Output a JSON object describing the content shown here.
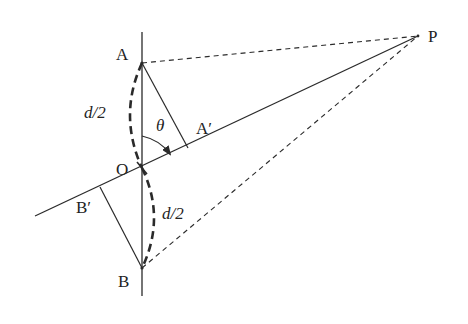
{
  "diagram": {
    "colors": {
      "line": "#2a2a2a",
      "background": "#ffffff"
    },
    "points": {
      "A": {
        "label": "A"
      },
      "O": {
        "label": "O"
      },
      "B": {
        "label": "B"
      },
      "P": {
        "label": "P"
      },
      "A_prime": {
        "label": "A′"
      },
      "B_prime": {
        "label": "B′"
      }
    },
    "segments": {
      "upper_half": {
        "label": "d/2"
      },
      "lower_half": {
        "label": "d/2"
      }
    },
    "angle": {
      "label": "θ"
    }
  }
}
